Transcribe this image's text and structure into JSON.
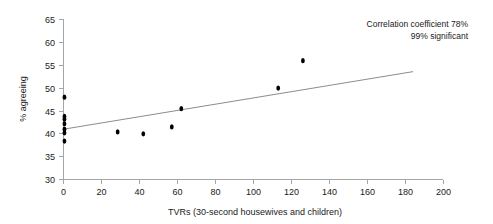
{
  "chart_data": {
    "type": "scatter",
    "title": "",
    "xlabel": "TVRs (30-second housewives and children)",
    "ylabel": "% agreeing",
    "xlim": [
      0,
      200
    ],
    "ylim": [
      30,
      65
    ],
    "xticks": [
      0,
      20,
      40,
      60,
      80,
      100,
      120,
      140,
      160,
      180,
      200
    ],
    "yticks": [
      30,
      35,
      40,
      45,
      50,
      55,
      60,
      65
    ],
    "grid": false,
    "legend": "none",
    "points": [
      {
        "x": 0.5,
        "y": 48.0
      },
      {
        "x": 0.5,
        "y": 43.8
      },
      {
        "x": 0.5,
        "y": 43.2
      },
      {
        "x": 0.5,
        "y": 42.2
      },
      {
        "x": 0.5,
        "y": 41.0
      },
      {
        "x": 0.5,
        "y": 40.2
      },
      {
        "x": 0.5,
        "y": 38.4
      },
      {
        "x": 28.5,
        "y": 40.4
      },
      {
        "x": 42.0,
        "y": 40.0
      },
      {
        "x": 57.0,
        "y": 41.5
      },
      {
        "x": 62.0,
        "y": 45.5
      },
      {
        "x": 113.0,
        "y": 50.0
      },
      {
        "x": 126.0,
        "y": 56.0
      }
    ],
    "trendline": {
      "x0": 0,
      "y0": 41.0,
      "x1": 184,
      "y1": 53.6
    },
    "annotations": [
      "Correlation coefficient 78%",
      "99% significant"
    ]
  },
  "ticks": {
    "y": {
      "t0": "65",
      "t1": "60",
      "t2": "55",
      "t3": "50",
      "t4": "45",
      "t5": "40",
      "t6": "35",
      "t7": "30"
    },
    "x": {
      "t0": "0",
      "t1": "20",
      "t2": "40",
      "t3": "60",
      "t4": "80",
      "t5": "100",
      "t6": "120",
      "t7": "140",
      "t8": "160",
      "t9": "180",
      "t10": "200"
    }
  },
  "labels": {
    "y_axis_title": "% agreeing",
    "x_axis_title": "TVRs (30-second housewives and children)"
  },
  "annotation": {
    "line1": "Correlation coefficient 78%",
    "line2": "99% significant"
  }
}
